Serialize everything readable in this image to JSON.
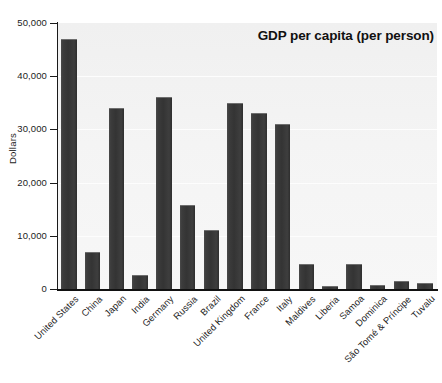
{
  "chart_data": {
    "type": "bar",
    "title": "GDP per capita (per person)",
    "xlabel": "",
    "ylabel": "Dollars",
    "ylim": [
      0,
      50000
    ],
    "yticks": [
      0,
      10000,
      20000,
      30000,
      40000,
      50000
    ],
    "ytick_labels": [
      "0",
      "10,000",
      "20,000",
      "30,000",
      "40,000",
      "50,000"
    ],
    "grid": true,
    "legend": null,
    "categories": [
      "United States",
      "China",
      "Japan",
      "India",
      "Germany",
      "Russia",
      "Brazil",
      "United Kingdom",
      "France",
      "Italy",
      "Maldives",
      "Liberia",
      "Samoa",
      "Dominica",
      "São Tomé & Príncipe",
      "Tuvalu"
    ],
    "values": [
      47000,
      7000,
      34000,
      2700,
      36000,
      15800,
      11000,
      35000,
      33000,
      31000,
      4700,
      550,
      4700,
      700,
      1500,
      1100
    ],
    "bar_color": "#3a3a3a",
    "plot_background": "#f4f4f4",
    "axis_color": "#1a1a1a"
  }
}
